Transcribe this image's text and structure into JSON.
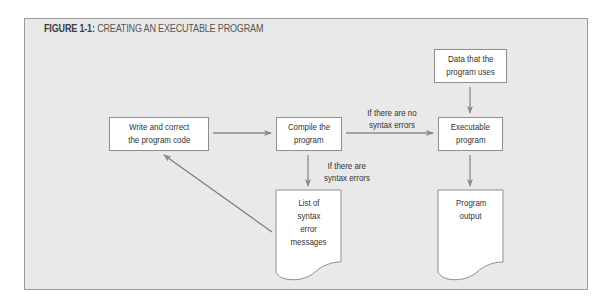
{
  "figure": {
    "label": "FIGURE 1-1:",
    "title": "CREATING AN EXECUTABLE PROGRAM"
  },
  "nodes": {
    "write": {
      "line1": "Write and correct",
      "line2": "the program code"
    },
    "compile": {
      "line1": "Compile the",
      "line2": "program"
    },
    "data": {
      "line1": "Data that the",
      "line2": "program uses"
    },
    "executable": {
      "line1": "Executable",
      "line2": "program"
    },
    "errors_doc": {
      "line1": "List of",
      "line2": "syntax",
      "line3": "error",
      "line4": "messages"
    },
    "output_doc": {
      "line1": "Program",
      "line2": "output"
    }
  },
  "edges": {
    "no_errors": {
      "line1": "If there are no",
      "line2": "syntax errors"
    },
    "has_errors": {
      "line1": "If there are",
      "line2": "syntax errors"
    }
  },
  "colors": {
    "panel_bg": "#e9e9e9",
    "border": "#9a9a9a",
    "arrow": "#8a8a8a",
    "box_bg": "#ffffff"
  }
}
